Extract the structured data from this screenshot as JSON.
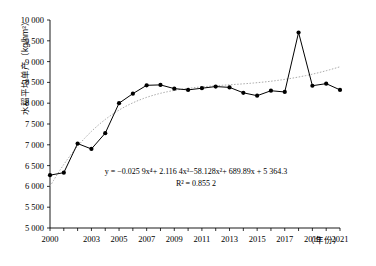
{
  "chart_data": {
    "type": "line",
    "title": "",
    "xlabel": "年份",
    "ylabel": "水稻平均单产（kg/hm²）",
    "ylim": [
      5000,
      10000
    ],
    "ytick_step": 500,
    "yticks": [
      "5 000",
      "5 500",
      "6 000",
      "6 500",
      "7 000",
      "7 500",
      "8 000",
      "8 500",
      "9 000",
      "9 500",
      "10 000"
    ],
    "xlim": [
      2000,
      2021
    ],
    "xticks": [
      "2000",
      "2003",
      "2005",
      "2007",
      "2009",
      "2011",
      "2013",
      "2015",
      "2017",
      "2019",
      "2021"
    ],
    "x": [
      2000,
      2001,
      2002,
      2003,
      2004,
      2005,
      2006,
      2007,
      2008,
      2009,
      2010,
      2011,
      2012,
      2013,
      2014,
      2015,
      2016,
      2017,
      2018,
      2019,
      2020,
      2021
    ],
    "values": [
      6270,
      6330,
      7030,
      6900,
      7280,
      8000,
      8230,
      8430,
      8440,
      8350,
      8320,
      8360,
      8400,
      8380,
      8250,
      8180,
      8300,
      8270,
      9700,
      8420,
      8470,
      8320
    ],
    "grid": false,
    "legend": "none",
    "series": [
      {
        "name": "水稻平均单产",
        "marker": "filled-circle",
        "line": "solid",
        "color": "#000000"
      },
      {
        "name": "趋势线（四次多项式拟合）",
        "marker": "none",
        "line": "dotted",
        "color": "#aaaaaa"
      }
    ],
    "annotations": {
      "equation": "y = −0.025 9x⁴+ 2.116 4x³−58.128x²+ 689.89x + 5 364.3",
      "r_squared": "R² = 0.855 2"
    }
  }
}
